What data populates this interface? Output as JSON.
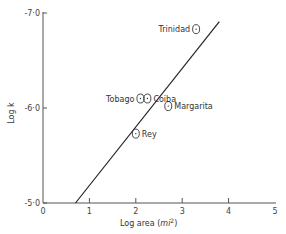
{
  "chart_data": {
    "type": "scatter",
    "title": "",
    "xlabel": "Log area (mi²)",
    "ylabel": "Log k",
    "xlim": [
      0,
      5
    ],
    "ylim": [
      -5.0,
      -7.0
    ],
    "x_ticks": [
      "0",
      "1",
      "2",
      "3",
      "4",
      "5"
    ],
    "y_ticks": [
      "-5.0",
      "-6.0",
      "-7.0"
    ],
    "grid": false,
    "legend": null,
    "points": [
      {
        "label": "Trinidad",
        "x": 3.3,
        "y": -6.83
      },
      {
        "label": "Tobago",
        "x": 2.1,
        "y": -6.1
      },
      {
        "label": "Coiba",
        "x": 2.25,
        "y": -6.1
      },
      {
        "label": "Margarita",
        "x": 2.7,
        "y": -6.02
      },
      {
        "label": "Rey",
        "x": 2.0,
        "y": -5.73
      }
    ],
    "fit_line": {
      "x": [
        0.7,
        3.8
      ],
      "y": [
        -5.0,
        -6.91
      ]
    }
  },
  "labels": {
    "xlabel_main": "Log area (",
    "xlabel_unit": "mi",
    "xlabel_sup": "2",
    "xlabel_close": ")",
    "ylabel": "Log k"
  }
}
